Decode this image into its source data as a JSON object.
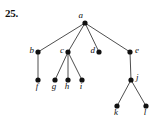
{
  "exercise": {
    "number": "25."
  },
  "figure": {
    "type": "rooted-tree-diagram",
    "background_color": "#ffffff",
    "node_color": "#111111",
    "edge_color": "#3a3a3a",
    "node_radius": 2.6,
    "width": 159,
    "height": 123,
    "nodes": [
      {
        "id": "a",
        "label": "a",
        "x": 85,
        "y": 23,
        "label_dx": -2,
        "label_dy": -5,
        "label_anchor": "end"
      },
      {
        "id": "b",
        "label": "b",
        "x": 38,
        "y": 52,
        "label_dx": -4,
        "label_dy": 1,
        "label_anchor": "end"
      },
      {
        "id": "c",
        "label": "c",
        "x": 68,
        "y": 52,
        "label_dx": -4,
        "label_dy": 1,
        "label_anchor": "end"
      },
      {
        "id": "d",
        "label": "d",
        "x": 99,
        "y": 52,
        "label_dx": -4,
        "label_dy": 1,
        "label_anchor": "end"
      },
      {
        "id": "e",
        "label": "e",
        "x": 130,
        "y": 52,
        "label_dx": 5,
        "label_dy": 1,
        "label_anchor": "start"
      },
      {
        "id": "f",
        "label": "f",
        "x": 38,
        "y": 80,
        "label_dx": -1,
        "label_dy": 9,
        "label_anchor": "middle"
      },
      {
        "id": "g",
        "label": "g",
        "x": 55,
        "y": 80,
        "label_dx": -1,
        "label_dy": 9,
        "label_anchor": "middle"
      },
      {
        "id": "h",
        "label": "h",
        "x": 68,
        "y": 80,
        "label_dx": -1,
        "label_dy": 9,
        "label_anchor": "middle"
      },
      {
        "id": "i",
        "label": "i",
        "x": 82,
        "y": 80,
        "label_dx": -1,
        "label_dy": 9,
        "label_anchor": "middle"
      },
      {
        "id": "j",
        "label": "j",
        "x": 131,
        "y": 80,
        "label_dx": 5,
        "label_dy": 0,
        "label_anchor": "start"
      },
      {
        "id": "k",
        "label": "k",
        "x": 117,
        "y": 106,
        "label_dx": -1,
        "label_dy": 9,
        "label_anchor": "middle"
      },
      {
        "id": "l",
        "label": "l",
        "x": 146,
        "y": 106,
        "label_dx": -1,
        "label_dy": 9,
        "label_anchor": "middle"
      }
    ],
    "edges": [
      {
        "from": "a",
        "to": "b"
      },
      {
        "from": "a",
        "to": "c"
      },
      {
        "from": "a",
        "to": "d"
      },
      {
        "from": "a",
        "to": "e"
      },
      {
        "from": "b",
        "to": "f"
      },
      {
        "from": "c",
        "to": "g"
      },
      {
        "from": "c",
        "to": "h"
      },
      {
        "from": "c",
        "to": "i"
      },
      {
        "from": "e",
        "to": "j"
      },
      {
        "from": "j",
        "to": "k"
      },
      {
        "from": "j",
        "to": "l"
      }
    ]
  }
}
